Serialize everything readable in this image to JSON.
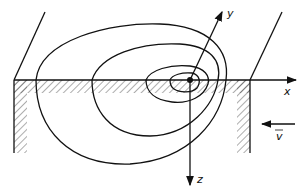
{
  "diagram": {
    "type": "isotherms of moving point heat source",
    "axes": {
      "x_label": "x",
      "y_label": "y",
      "z_label": "z"
    },
    "velocity_label": "v",
    "velocity_has_vector_arrow": true,
    "isotherm_count": 4,
    "colors": {
      "line": "#111111",
      "background": "#ffffff"
    }
  }
}
